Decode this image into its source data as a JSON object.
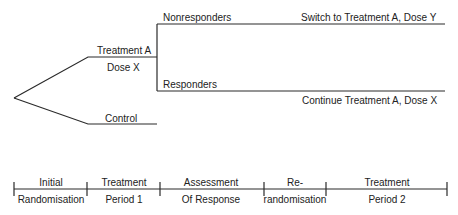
{
  "diagram": {
    "tree": {
      "treatment_arm": {
        "label": "Treatment A",
        "sublabel": "Dose X"
      },
      "control_arm": {
        "label": "Control"
      },
      "nonresponders": {
        "label": "Nonresponders",
        "outcome": "Switch to Treatment A, Dose Y"
      },
      "responders": {
        "label": "Responders",
        "outcome": "Continue Treatment A, Dose X"
      }
    },
    "timeline": {
      "phases": [
        {
          "top": "Initial",
          "bottom": "Randomisation"
        },
        {
          "top": "Treatment",
          "bottom": "Period 1"
        },
        {
          "top": "Assessment",
          "bottom": "Of Response"
        },
        {
          "top": "Re-",
          "bottom": "randomisation"
        },
        {
          "top": "Treatment",
          "bottom": "Period 2"
        }
      ]
    }
  }
}
